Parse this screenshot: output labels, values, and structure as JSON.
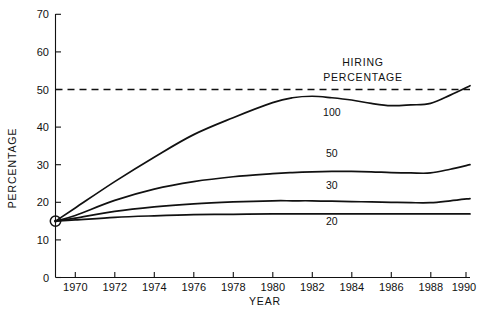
{
  "chart_data": {
    "type": "line",
    "title": "",
    "xlabel": "YEAR",
    "ylabel": "PERCENTAGE",
    "xlim": [
      1969,
      1990
    ],
    "ylim": [
      0,
      70
    ],
    "yticks": [
      0,
      10,
      20,
      30,
      40,
      50,
      60,
      70
    ],
    "xticks": [
      1970,
      1972,
      1974,
      1976,
      1978,
      1980,
      1982,
      1984,
      1986,
      1988,
      1990
    ],
    "grid": false,
    "legend_position": "inline-annotations",
    "annotations": [
      {
        "name": "hiring-percentage-legend",
        "text_line1": "HIRING",
        "text_line2": "PERCENTAGE",
        "x": 1982,
        "y": 57
      },
      {
        "name": "threshold-note",
        "text": "50% dashed reference line",
        "value": 50
      }
    ],
    "reference_lines": [
      {
        "name": "hiring-percentage-threshold",
        "orientation": "horizontal",
        "value": 50,
        "style": "dashed"
      }
    ],
    "x": [
      1969,
      1970,
      1972,
      1974,
      1976,
      1978,
      1980,
      1981,
      1982,
      1983,
      1984,
      1985,
      1986,
      1987,
      1988,
      1989,
      1990
    ],
    "series": [
      {
        "name": "100",
        "label": "100",
        "label_x": 1983,
        "label_y": 43,
        "values": [
          15,
          18.5,
          25.5,
          32,
          38,
          42.5,
          46.5,
          47.8,
          48.2,
          47.8,
          47.2,
          46.3,
          45.7,
          45.9,
          46.3,
          48.5,
          51
        ]
      },
      {
        "name": "50",
        "label": "50",
        "label_x": 1983,
        "label_y": 32,
        "values": [
          15,
          16.5,
          20.5,
          23.5,
          25.5,
          26.8,
          27.6,
          27.9,
          28.1,
          28.2,
          28.2,
          28.1,
          27.9,
          27.8,
          27.8,
          28.8,
          30
        ]
      },
      {
        "name": "30",
        "label": "30",
        "label_x": 1983,
        "label_y": 23.5,
        "values": [
          15,
          15.8,
          17.6,
          18.8,
          19.6,
          20.1,
          20.4,
          20.4,
          20.4,
          20.3,
          20.2,
          20.1,
          20.0,
          19.9,
          19.9,
          20.4,
          21
        ]
      },
      {
        "name": "20",
        "label": "20",
        "label_x": 1983,
        "label_y": 14,
        "values": [
          15,
          15.3,
          16.0,
          16.4,
          16.7,
          16.8,
          16.9,
          16.9,
          16.9,
          16.9,
          16.9,
          16.9,
          16.9,
          16.9,
          16.9,
          16.9,
          16.9
        ]
      }
    ],
    "origin_marker": {
      "name": "origin-point",
      "x": 1969,
      "y": 15,
      "style": "circle-with-dot"
    }
  },
  "colors": {
    "ink": "#111111",
    "background": "#ffffff"
  },
  "labels": {
    "y_tick_0": "0",
    "y_tick_10": "10",
    "y_tick_20": "20",
    "y_tick_30": "30",
    "y_tick_40": "40",
    "y_tick_50": "50",
    "y_tick_60": "60",
    "y_tick_70": "70",
    "x_tick_1970": "1970",
    "x_tick_1972": "1972",
    "x_tick_1974": "1974",
    "x_tick_1976": "1976",
    "x_tick_1978": "1978",
    "x_tick_1980": "1980",
    "x_tick_1982": "1982",
    "x_tick_1984": "1984",
    "x_tick_1986": "1986",
    "x_tick_1988": "1988",
    "x_tick_1990": "1990",
    "x_axis_title": "YEAR",
    "y_axis_title": "PERCENTAGE",
    "legend_line1": "HIRING",
    "legend_line2": "PERCENTAGE",
    "curve_100": "100",
    "curve_50": "50",
    "curve_30": "30",
    "curve_20": "20"
  }
}
